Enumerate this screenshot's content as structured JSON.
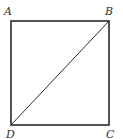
{
  "diagram": {
    "type": "geometry",
    "stroke_color": "#2a2a2a",
    "vertices": [
      {
        "name": "A",
        "x": 11,
        "y": 21,
        "label_x": 4,
        "label_y": 15
      },
      {
        "name": "B",
        "x": 109,
        "y": 21,
        "label_x": 105,
        "label_y": 15
      },
      {
        "name": "C",
        "x": 109,
        "y": 125,
        "label_x": 106,
        "label_y": 138
      },
      {
        "name": "D",
        "x": 11,
        "y": 125,
        "label_x": 6,
        "label_y": 138
      }
    ],
    "segments": [
      {
        "from": "A",
        "to": "B"
      },
      {
        "from": "B",
        "to": "C"
      },
      {
        "from": "C",
        "to": "D"
      },
      {
        "from": "D",
        "to": "A"
      },
      {
        "from": "B",
        "to": "D",
        "kind": "diagonal"
      }
    ],
    "labels": {
      "A": "A",
      "B": "B",
      "C": "C",
      "D": "D"
    }
  }
}
